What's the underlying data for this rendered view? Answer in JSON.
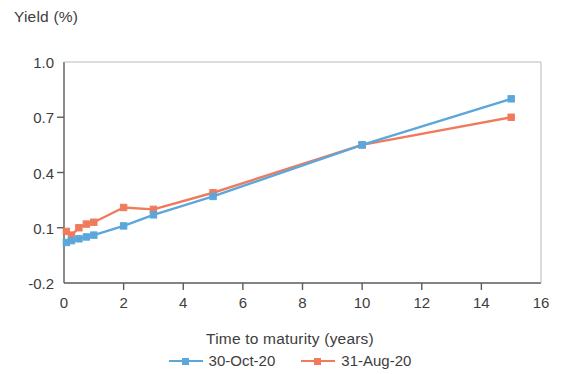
{
  "chart_data": {
    "type": "line",
    "title": "",
    "xlabel": "Time to maturity (years)",
    "ylabel": "Yield (%)",
    "xlim": [
      0,
      16
    ],
    "ylim": [
      -0.2,
      1.0
    ],
    "xticks": [
      "0",
      "2",
      "4",
      "6",
      "8",
      "10",
      "12",
      "14",
      "16"
    ],
    "xtick_values": [
      0,
      2,
      4,
      6,
      8,
      10,
      12,
      14,
      16
    ],
    "yticks": [
      "1.0",
      "0.7",
      "0.4",
      "0.1",
      "-0.2"
    ],
    "ytick_values": [
      1.0,
      0.7,
      0.4,
      0.1,
      -0.2
    ],
    "grid": false,
    "legend_position": "bottom",
    "marker": "square",
    "series": [
      {
        "name": "30-Oct-20",
        "color": "#5BA7DB",
        "x": [
          0.08,
          0.25,
          0.5,
          0.75,
          1,
          2,
          3,
          5,
          10,
          15
        ],
        "values": [
          0.02,
          0.03,
          0.04,
          0.05,
          0.06,
          0.11,
          0.17,
          0.27,
          0.55,
          0.8
        ]
      },
      {
        "name": "31-Aug-20",
        "color": "#EF7B5C",
        "x": [
          0.08,
          0.25,
          0.5,
          0.75,
          1,
          2,
          3,
          5,
          10,
          15
        ],
        "values": [
          0.08,
          0.06,
          0.1,
          0.12,
          0.13,
          0.21,
          0.2,
          0.29,
          0.55,
          0.7
        ]
      }
    ]
  },
  "legend": {
    "entries": [
      {
        "label": "30-Oct-20",
        "color": "#5BA7DB"
      },
      {
        "label": "31-Aug-20",
        "color": "#EF7B5C"
      }
    ]
  },
  "axes": {
    "axis_color": "#5a5a5a"
  }
}
